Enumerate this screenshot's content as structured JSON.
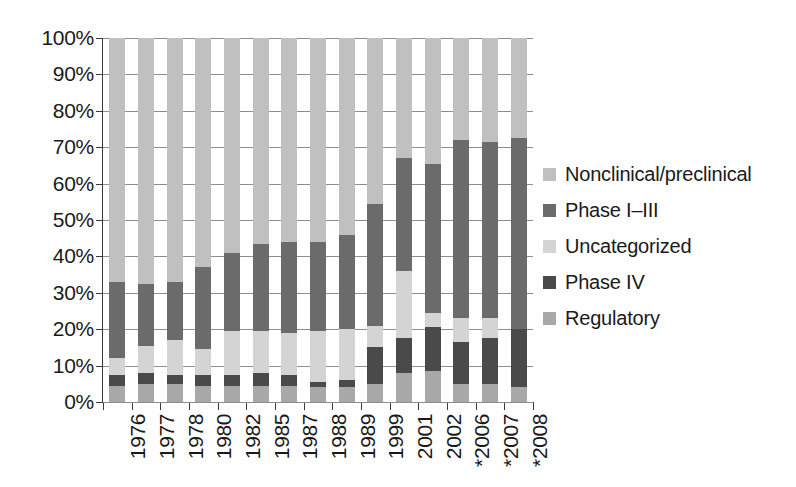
{
  "chart_data": {
    "type": "bar",
    "subtype": "stacked-percent",
    "title": "",
    "xlabel": "",
    "ylabel": "",
    "ylim": [
      0,
      100
    ],
    "grid": true,
    "legend_position": "right",
    "y_tick_labels": [
      "100%",
      "90%",
      "80%",
      "70%",
      "60%",
      "50%",
      "40%",
      "30%",
      "20%",
      "10%",
      "0%"
    ],
    "y_tick_values": [
      100,
      90,
      80,
      70,
      60,
      50,
      40,
      30,
      20,
      10,
      0
    ],
    "categories": [
      "1976",
      "1977",
      "1978",
      "1980",
      "1982",
      "1985",
      "1987",
      "1988",
      "1989",
      "1999",
      "2001",
      "2002",
      "*2006",
      "*2007",
      "*2008"
    ],
    "series": [
      {
        "name": "Regulatory",
        "color": "#a8a8a8",
        "values": [
          4.5,
          5.0,
          5.0,
          4.5,
          4.5,
          4.5,
          4.5,
          4.0,
          4.0,
          5.0,
          8.0,
          8.5,
          5.0,
          5.0,
          4.0
        ]
      },
      {
        "name": "Phase IV",
        "color": "#4a4a4a",
        "values": [
          3.0,
          3.0,
          2.5,
          3.0,
          3.0,
          3.5,
          3.0,
          1.5,
          2.0,
          10.0,
          9.5,
          12.0,
          11.5,
          12.5,
          16.0
        ]
      },
      {
        "name": "Uncategorized",
        "color": "#d4d4d4",
        "values": [
          4.5,
          7.5,
          9.5,
          7.0,
          12.0,
          11.5,
          11.5,
          14.0,
          14.0,
          6.0,
          18.5,
          4.0,
          6.5,
          5.5,
          0.0
        ]
      },
      {
        "name": "Phase I–III",
        "color": "#6b6b6b",
        "values": [
          21.0,
          17.0,
          16.0,
          22.5,
          21.5,
          24.0,
          25.0,
          24.5,
          26.0,
          33.5,
          31.0,
          41.0,
          49.0,
          48.5,
          52.5
        ]
      },
      {
        "name": "Nonclinical/preclinical",
        "color": "#c0c0c0",
        "values": [
          67.0,
          67.5,
          67.0,
          63.0,
          59.0,
          56.5,
          56.0,
          56.0,
          54.0,
          45.5,
          33.0,
          34.5,
          28.0,
          28.5,
          27.5
        ]
      }
    ],
    "stack_tops": {
      "note": "cumulative top of the Phase I–III segment per category (percent)",
      "values": [
        33.0,
        32.5,
        33.0,
        37.0,
        41.0,
        43.5,
        44.0,
        44.0,
        46.0,
        54.5,
        67.0,
        65.5,
        72.0,
        71.5,
        72.5
      ]
    }
  },
  "legend": {
    "items": [
      {
        "label": "Nonclinical/preclinical",
        "color": "#c0c0c0"
      },
      {
        "label": "Phase I–III",
        "color": "#6b6b6b"
      },
      {
        "label": "Uncategorized",
        "color": "#d4d4d4"
      },
      {
        "label": "Phase IV",
        "color": "#4a4a4a"
      },
      {
        "label": "Regulatory",
        "color": "#a8a8a8"
      }
    ]
  }
}
